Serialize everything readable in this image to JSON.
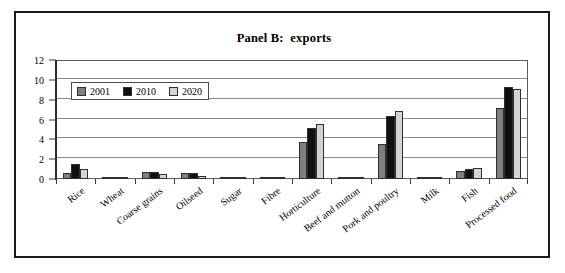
{
  "figure": {
    "title": "Panel B:  exports",
    "background_color": "#ffffff",
    "frame_color": "#1b1b1b"
  },
  "chart_data": {
    "type": "bar",
    "title": "Panel B:  exports",
    "xlabel": "",
    "ylabel": "",
    "ylim": [
      0,
      12
    ],
    "yticks": [
      0,
      2,
      4,
      6,
      8,
      10,
      12
    ],
    "ytick_labels": [
      "0",
      "2",
      "4",
      "6",
      "8",
      "10",
      "12"
    ],
    "grid": true,
    "legend_position": "upper-left",
    "categories": [
      "Rice",
      "Wheat",
      "Coarse grains",
      "Oilseed",
      "Sugar",
      "Fibre",
      "Horticulture",
      "Beef and mutton",
      "Pork and poultry",
      "Milk",
      "Fish",
      "Processed food"
    ],
    "series": [
      {
        "name": "2001",
        "color": "#7f7f7f",
        "values": [
          0.6,
          0.1,
          0.7,
          0.6,
          0.02,
          0.05,
          3.7,
          0.2,
          3.5,
          0.15,
          0.8,
          7.2
        ]
      },
      {
        "name": "2010",
        "color": "#101010",
        "values": [
          1.5,
          0.1,
          0.7,
          0.6,
          0.02,
          0.15,
          5.15,
          0.2,
          6.4,
          0.15,
          1.0,
          9.3
        ]
      },
      {
        "name": "2020",
        "color": "#d4d4d4",
        "values": [
          1.0,
          0.05,
          0.5,
          0.3,
          0.02,
          0.05,
          5.55,
          0.15,
          6.9,
          0.15,
          1.1,
          9.1
        ]
      }
    ]
  }
}
